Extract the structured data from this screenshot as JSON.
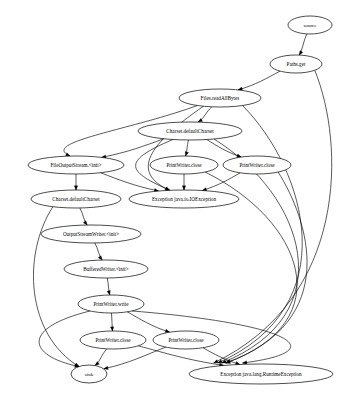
{
  "graph": {
    "type": "directed-graph",
    "title": "",
    "background_color": "#ffffff",
    "node_fill_color": "#ffffff",
    "node_stroke_color": "#000000",
    "edge_color": "#000000",
    "width": 359,
    "height": 399,
    "nodes": [
      {
        "id": "source",
        "label": "source",
        "cx": 310,
        "cy": 25,
        "rx": 22,
        "ry": 9,
        "font_size": 5.0
      },
      {
        "id": "pathsget",
        "label": "Paths.get",
        "cx": 296,
        "cy": 64,
        "rx": 26,
        "ry": 9,
        "font_size": 5.2
      },
      {
        "id": "readall",
        "label": "Files.readAllBytes",
        "cx": 220,
        "cy": 98,
        "rx": 41,
        "ry": 9,
        "font_size": 5.2
      },
      {
        "id": "charset1",
        "label": "Charset.defaultCharset",
        "cx": 190,
        "cy": 131,
        "rx": 52,
        "ry": 9,
        "font_size": 5.2
      },
      {
        "id": "fos",
        "label": "FileOutputStream.<init>",
        "cx": 76,
        "cy": 165,
        "rx": 48,
        "ry": 9,
        "font_size": 5.2
      },
      {
        "id": "pwclose1",
        "label": "PrintWriter.close",
        "cx": 184,
        "cy": 165,
        "rx": 34,
        "ry": 9,
        "font_size": 5.2
      },
      {
        "id": "pwclose2",
        "label": "PrintWriter.close",
        "cx": 257,
        "cy": 165,
        "rx": 34,
        "ry": 9,
        "font_size": 5.2
      },
      {
        "id": "charset2",
        "label": "Charset.defaultCharset",
        "cx": 76,
        "cy": 199,
        "rx": 45,
        "ry": 9,
        "font_size": 5.2
      },
      {
        "id": "ioexc",
        "label": "Exception java.io.IOException",
        "cx": 184,
        "cy": 199,
        "rx": 55,
        "ry": 9,
        "font_size": 5.2
      },
      {
        "id": "osw",
        "label": "OutputStreamWriter.<init>",
        "cx": 91,
        "cy": 234,
        "rx": 50,
        "ry": 9,
        "font_size": 5.2
      },
      {
        "id": "bw",
        "label": "BufferedWriter.<init>",
        "cx": 106,
        "cy": 269,
        "rx": 42,
        "ry": 9,
        "font_size": 5.2
      },
      {
        "id": "pwwrite",
        "label": "PrintWriter.write",
        "cx": 111,
        "cy": 304,
        "rx": 33,
        "ry": 9,
        "font_size": 5.2
      },
      {
        "id": "pwclose3",
        "label": "PrintWriter.close",
        "cx": 113,
        "cy": 340,
        "rx": 33,
        "ry": 9,
        "font_size": 5.2
      },
      {
        "id": "pwclose4",
        "label": "PrintWriter.close",
        "cx": 186,
        "cy": 340,
        "rx": 33,
        "ry": 9,
        "font_size": 5.2
      },
      {
        "id": "sink",
        "label": "sink",
        "cx": 89,
        "cy": 374,
        "rx": 18,
        "ry": 9,
        "font_size": 5.0
      },
      {
        "id": "rtexc",
        "label": "Exception java.lang.RuntimeException",
        "cx": 261,
        "cy": 374,
        "rx": 72,
        "ry": 10,
        "font_size": 5.2
      }
    ],
    "edges": [
      {
        "from": "source",
        "to": "pathsget"
      },
      {
        "from": "pathsget",
        "to": "readall"
      },
      {
        "from": "pathsget",
        "to": "rtexc"
      },
      {
        "from": "readall",
        "to": "charset1"
      },
      {
        "from": "readall",
        "to": "fos"
      },
      {
        "from": "readall",
        "to": "ioexc"
      },
      {
        "from": "readall",
        "to": "rtexc"
      },
      {
        "from": "charset1",
        "to": "fos"
      },
      {
        "from": "charset1",
        "to": "pwclose1"
      },
      {
        "from": "charset1",
        "to": "pwclose2"
      },
      {
        "from": "charset1",
        "to": "ioexc"
      },
      {
        "from": "charset1",
        "to": "rtexc"
      },
      {
        "from": "fos",
        "to": "charset2"
      },
      {
        "from": "fos",
        "to": "ioexc"
      },
      {
        "from": "pwclose1",
        "to": "ioexc"
      },
      {
        "from": "pwclose1",
        "to": "rtexc"
      },
      {
        "from": "pwclose2",
        "to": "ioexc"
      },
      {
        "from": "pwclose2",
        "to": "rtexc"
      },
      {
        "from": "charset2",
        "to": "osw"
      },
      {
        "from": "charset2",
        "to": "sink"
      },
      {
        "from": "osw",
        "to": "bw"
      },
      {
        "from": "bw",
        "to": "pwwrite"
      },
      {
        "from": "pwwrite",
        "to": "pwclose3"
      },
      {
        "from": "pwwrite",
        "to": "pwclose4"
      },
      {
        "from": "pwwrite",
        "to": "sink"
      },
      {
        "from": "pwwrite",
        "to": "rtexc"
      },
      {
        "from": "pwclose3",
        "to": "sink"
      },
      {
        "from": "pwclose3",
        "to": "rtexc"
      },
      {
        "from": "pwclose4",
        "to": "sink"
      },
      {
        "from": "pwclose4",
        "to": "rtexc"
      }
    ]
  }
}
